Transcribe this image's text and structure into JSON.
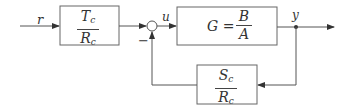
{
  "diagram": {
    "type": "feedback-control-block-diagram",
    "signals": {
      "input": "r",
      "control": "u",
      "output": "y"
    },
    "blocks": {
      "feedforward": {
        "num": "T",
        "num_sub": "c",
        "den": "R",
        "den_sub": "c"
      },
      "plant": {
        "prefix": "G =",
        "num": "B",
        "den": "A"
      },
      "feedback": {
        "num": "S",
        "num_sub": "c",
        "den": "R",
        "den_sub": "c"
      }
    },
    "summing_junction": {
      "sign": "−"
    },
    "colors": {
      "line": "#555555",
      "box": "#666666",
      "text": "#333333"
    }
  }
}
